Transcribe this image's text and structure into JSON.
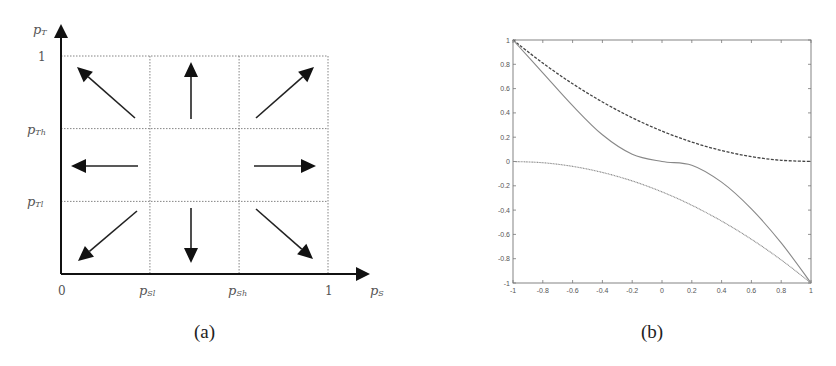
{
  "figure": {
    "panel_a": {
      "caption": "(a)",
      "x_axis_label": "p_S",
      "y_axis_label": "p_T",
      "x_ticks": [
        {
          "label": "0",
          "value": 0
        },
        {
          "label": "p_Sl",
          "value": 0.333
        },
        {
          "label": "p_Sh",
          "value": 0.667
        },
        {
          "label": "1",
          "value": 1
        }
      ],
      "y_ticks": [
        {
          "label": "1",
          "value": 1
        },
        {
          "label": "p_Th",
          "value": 0.667
        },
        {
          "label": "p_Tl",
          "value": 0.333
        }
      ],
      "arrows": [
        {
          "region": "top-left",
          "direction": "up-left"
        },
        {
          "region": "top-center",
          "direction": "up"
        },
        {
          "region": "top-right",
          "direction": "up-right"
        },
        {
          "region": "middle-left",
          "direction": "left"
        },
        {
          "region": "middle-right",
          "direction": "right"
        },
        {
          "region": "bottom-left",
          "direction": "down-left"
        },
        {
          "region": "bottom-center",
          "direction": "down"
        },
        {
          "region": "bottom-right",
          "direction": "down-right"
        }
      ]
    },
    "panel_b": {
      "caption": "(b)"
    }
  },
  "chart_data": [
    {
      "type": "diagram",
      "title": "(a)",
      "xlabel": "pS",
      "ylabel": "pT",
      "x_tick_labels": [
        "0",
        "pSl",
        "pSh",
        "1"
      ],
      "y_tick_labels": [
        "1",
        "pTh",
        "pTl"
      ],
      "grid": "dotted lines at pSl, pSh, 1 (vertical) and pTl, pTh, 1 (horizontal)",
      "arrows": [
        "up-left",
        "up",
        "up-right",
        "left",
        "right",
        "down-left",
        "down",
        "down-right"
      ],
      "center_cell": "no arrow"
    },
    {
      "type": "line",
      "title": "(b)",
      "xlabel": "",
      "ylabel": "",
      "xlim": [
        -1,
        1
      ],
      "ylim": [
        -1,
        1
      ],
      "grid": false,
      "x_tick_labels": [
        "-1",
        "-0.8",
        "-0.6",
        "-0.4",
        "-0.2",
        "0",
        "0.2",
        "0.4",
        "0.6",
        "0.8",
        "1"
      ],
      "y_tick_labels": [
        "1",
        "0.8",
        "0.6",
        "0.4",
        "0.2",
        "0",
        "-0.2",
        "-0.4",
        "-0.6",
        "-0.8",
        "-1"
      ],
      "x": [
        -1,
        -0.8,
        -0.6,
        -0.4,
        -0.2,
        0,
        0.2,
        0.4,
        0.6,
        0.8,
        1
      ],
      "series": [
        {
          "name": "dashed upper",
          "style": "dashed",
          "values": [
            1,
            0.81,
            0.64,
            0.49,
            0.36,
            0.25,
            0.16,
            0.09,
            0.04,
            0.01,
            0
          ]
        },
        {
          "name": "solid middle",
          "style": "solid",
          "values": [
            1,
            0.73,
            0.46,
            0.22,
            0.06,
            0,
            -0.03,
            -0.17,
            -0.39,
            -0.67,
            -1
          ]
        },
        {
          "name": "dotted lower",
          "style": "dotted",
          "values": [
            0,
            -0.01,
            -0.04,
            -0.09,
            -0.16,
            -0.25,
            -0.36,
            -0.49,
            -0.64,
            -0.81,
            -1
          ]
        }
      ]
    }
  ]
}
